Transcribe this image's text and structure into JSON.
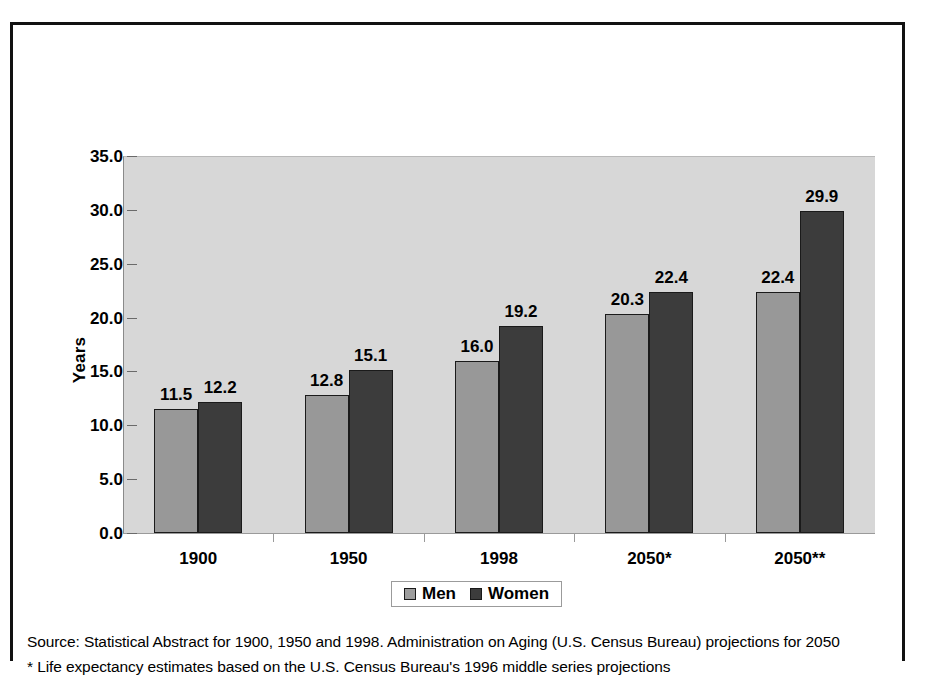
{
  "chart_data": {
    "type": "bar",
    "title": "",
    "xlabel": "",
    "ylabel": "Years",
    "ylim": [
      0,
      35
    ],
    "ytick_step": 5,
    "grid": false,
    "legend_position": "bottom",
    "categories": [
      "1900",
      "1950",
      "1998",
      "2050*",
      "2050**"
    ],
    "ytick_labels": [
      "0.0",
      "5.0",
      "10.0",
      "15.0",
      "20.0",
      "25.0",
      "30.0",
      "35.0"
    ],
    "series": [
      {
        "name": "Men",
        "color": "#989898",
        "values": [
          11.5,
          12.8,
          16.0,
          20.3,
          22.4
        ]
      },
      {
        "name": "Women",
        "color": "#3c3c3c",
        "values": [
          12.2,
          15.1,
          19.2,
          22.4,
          29.9
        ]
      }
    ],
    "data_labels": [
      [
        "11.5",
        "12.2"
      ],
      [
        "12.8",
        "15.1"
      ],
      [
        "16.0",
        "19.2"
      ],
      [
        "20.3",
        "22.4"
      ],
      [
        "22.4",
        "29.9"
      ]
    ],
    "annotations": [
      "Source: Statistical Abstract for 1900, 1950 and 1998. Administration on Aging (U.S. Census Bureau) projections for 2050",
      "* Life expectancy estimates based on the U.S. Census Bureau's 1996 middle series projections"
    ]
  },
  "axis": {
    "y_title": "Years"
  },
  "legend": {
    "items": [
      {
        "label": "Men"
      },
      {
        "label": "Women"
      }
    ]
  },
  "footnotes": {
    "source_line": "Source: Statistical Abstract for 1900, 1950 and 1998. Administration on Aging (U.S. Census Bureau) projections for 2050",
    "star_line": "* Life expectancy estimates based on the U.S. Census Bureau's 1996 middle series projections"
  },
  "colors": {
    "men": "#989898",
    "women": "#3c3c3c",
    "plot_background": "#d7d7d7",
    "frame": "#111111"
  }
}
